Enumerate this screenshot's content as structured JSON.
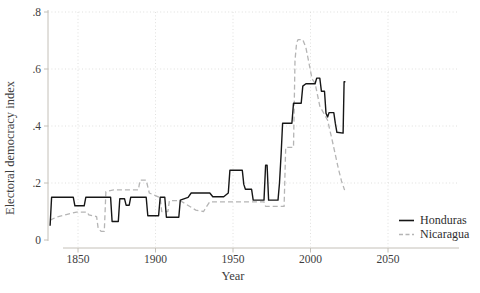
{
  "chart_data": {
    "type": "line",
    "title": "",
    "xlabel": "Year",
    "ylabel": "Electoral democracy index",
    "xlim": [
      1830,
      2095
    ],
    "ylim": [
      0,
      0.8
    ],
    "x_ticks": [
      1850,
      1900,
      1950,
      2000,
      2050
    ],
    "x_tick_labels": [
      "1850",
      "1900",
      "1950",
      "2000",
      "2050"
    ],
    "y_ticks": [
      0,
      0.2,
      0.4,
      0.6,
      0.8
    ],
    "y_tick_labels": [
      "0",
      ".2",
      ".4",
      ".6",
      ".8"
    ],
    "grid": true,
    "grid_style": "dotted",
    "legend_position": "inside-bottom-right",
    "axis_color": "#c4c0b8",
    "grid_color": "#dcdcda",
    "text_color": "#3d3d3d",
    "series": [
      {
        "name": "Honduras",
        "color": "#161616",
        "style": "solid",
        "points": [
          [
            1832,
            0.05
          ],
          [
            1833,
            0.15
          ],
          [
            1847,
            0.15
          ],
          [
            1848,
            0.12
          ],
          [
            1854,
            0.12
          ],
          [
            1855,
            0.15
          ],
          [
            1871,
            0.15
          ],
          [
            1872,
            0.065
          ],
          [
            1876,
            0.065
          ],
          [
            1877,
            0.145
          ],
          [
            1880,
            0.145
          ],
          [
            1881,
            0.122
          ],
          [
            1883,
            0.122
          ],
          [
            1884,
            0.15
          ],
          [
            1894,
            0.15
          ],
          [
            1895,
            0.085
          ],
          [
            1902,
            0.085
          ],
          [
            1903,
            0.15
          ],
          [
            1906,
            0.15
          ],
          [
            1907,
            0.08
          ],
          [
            1915,
            0.08
          ],
          [
            1916,
            0.14
          ],
          [
            1921,
            0.15
          ],
          [
            1923,
            0.165
          ],
          [
            1935,
            0.165
          ],
          [
            1937,
            0.152
          ],
          [
            1944,
            0.152
          ],
          [
            1947,
            0.165
          ],
          [
            1948,
            0.245
          ],
          [
            1956,
            0.245
          ],
          [
            1957,
            0.195
          ],
          [
            1958,
            0.178
          ],
          [
            1962,
            0.178
          ],
          [
            1963,
            0.14
          ],
          [
            1970,
            0.14
          ],
          [
            1971,
            0.262
          ],
          [
            1972,
            0.262
          ],
          [
            1973,
            0.14
          ],
          [
            1979,
            0.14
          ],
          [
            1980,
            0.2
          ],
          [
            1981,
            0.3
          ],
          [
            1982,
            0.41
          ],
          [
            1988,
            0.41
          ],
          [
            1989,
            0.48
          ],
          [
            1994,
            0.48
          ],
          [
            1995,
            0.54
          ],
          [
            1997,
            0.548
          ],
          [
            2003,
            0.548
          ],
          [
            2004,
            0.568
          ],
          [
            2006,
            0.568
          ],
          [
            2007,
            0.522
          ],
          [
            2009,
            0.522
          ],
          [
            2010,
            0.445
          ],
          [
            2011,
            0.432
          ],
          [
            2012,
            0.447
          ],
          [
            2015,
            0.447
          ],
          [
            2016,
            0.41
          ],
          [
            2017,
            0.378
          ],
          [
            2021,
            0.375
          ],
          [
            2021.7,
            0.555
          ],
          [
            2022.5,
            0.555
          ]
        ]
      },
      {
        "name": "Nicaragua",
        "color": "#b5b5b5",
        "style": "dashed",
        "points": [
          [
            1832,
            0.07
          ],
          [
            1836,
            0.08
          ],
          [
            1843,
            0.09
          ],
          [
            1849,
            0.098
          ],
          [
            1856,
            0.098
          ],
          [
            1857,
            0.088
          ],
          [
            1862,
            0.082
          ],
          [
            1863,
            0.04
          ],
          [
            1865,
            0.03
          ],
          [
            1867,
            0.03
          ],
          [
            1868,
            0.17
          ],
          [
            1873,
            0.176
          ],
          [
            1889,
            0.176
          ],
          [
            1890,
            0.21
          ],
          [
            1894,
            0.21
          ],
          [
            1896,
            0.165
          ],
          [
            1903,
            0.148
          ],
          [
            1904,
            0.1
          ],
          [
            1908,
            0.1
          ],
          [
            1909,
            0.138
          ],
          [
            1916,
            0.138
          ],
          [
            1919,
            0.128
          ],
          [
            1926,
            0.105
          ],
          [
            1931,
            0.1
          ],
          [
            1933,
            0.118
          ],
          [
            1935,
            0.134
          ],
          [
            1970,
            0.134
          ],
          [
            1971,
            0.118
          ],
          [
            1983,
            0.118
          ],
          [
            1984,
            0.325
          ],
          [
            1989,
            0.325
          ],
          [
            1990,
            0.63
          ],
          [
            1991,
            0.692
          ],
          [
            1992,
            0.703
          ],
          [
            1995,
            0.703
          ],
          [
            1997,
            0.675
          ],
          [
            1999,
            0.62
          ],
          [
            2001,
            0.565
          ],
          [
            2003,
            0.55
          ],
          [
            2006,
            0.47
          ],
          [
            2011,
            0.42
          ],
          [
            2014,
            0.35
          ],
          [
            2016,
            0.3
          ],
          [
            2018,
            0.25
          ],
          [
            2020,
            0.207
          ],
          [
            2022,
            0.175
          ]
        ]
      }
    ]
  },
  "legend": {
    "items": [
      {
        "label": "Honduras"
      },
      {
        "label": "Nicaragua"
      }
    ]
  }
}
